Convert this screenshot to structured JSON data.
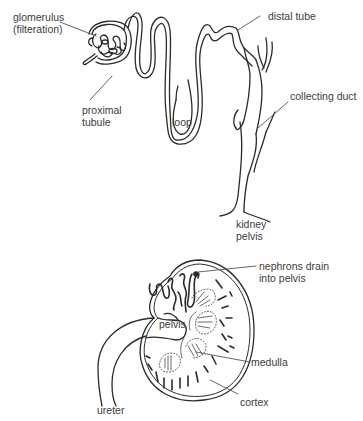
{
  "diagram": {
    "title": "",
    "nephron": {
      "labels": {
        "glomerulus": "glomerulus\n(filteration)",
        "distal_tube": "distal tube",
        "proximal_tubule": "proximal\ntubule",
        "loop": "loop",
        "collecting_duct": "collecting duct",
        "kidney_pelvis": "kidney\npelvis"
      }
    },
    "kidney": {
      "labels": {
        "nephrons_drain": "nephrons drain\ninto pelvis",
        "pelvis": "pelvis",
        "medulla": "medulla",
        "cortex": "cortex",
        "ureter": "ureter"
      }
    },
    "colors": {
      "line": "#2b2b2b",
      "text": "#3c3c3c",
      "background": "#ffffff"
    }
  }
}
